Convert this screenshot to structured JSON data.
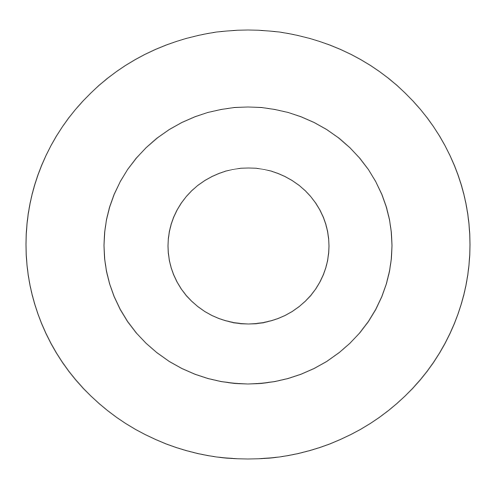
{
  "diagram": {
    "type": "concentric-circles",
    "background": "#ffffff",
    "stroke_color": "#4a4a4a",
    "stroke_width": 1.1,
    "rings": [
      {
        "name": "outer-ring",
        "cx": 248,
        "cy": 244.5,
        "rx": 222,
        "ry": 214.5
      },
      {
        "name": "middle-ring",
        "cx": 248,
        "cy": 245.5,
        "rx": 144,
        "ry": 138.5
      },
      {
        "name": "inner-ring",
        "cx": 248.5,
        "cy": 246,
        "rx": 80.5,
        "ry": 78
      }
    ]
  }
}
